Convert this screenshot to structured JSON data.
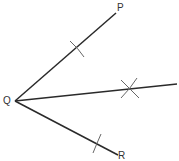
{
  "diagram": {
    "type": "angle-bisector-construction",
    "colors": {
      "ray": "#2a2a2a",
      "arc": "#666666",
      "label": "#333333"
    },
    "vertex": {
      "label": "Q",
      "x": 15,
      "y": 101
    },
    "points": [
      {
        "label": "P",
        "x": 116,
        "y": 13
      },
      {
        "label": "R",
        "x": 118,
        "y": 155
      }
    ],
    "bisector_end": {
      "x": 177,
      "y": 84
    },
    "arc_marks": [
      {
        "on": "QP",
        "x": 78,
        "y": 48
      },
      {
        "on": "QR",
        "x": 97,
        "y": 143
      },
      {
        "on": "bisector",
        "x": 130,
        "y": 89,
        "type": "cross"
      }
    ]
  }
}
